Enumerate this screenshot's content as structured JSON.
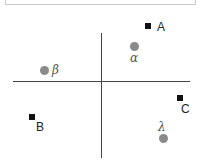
{
  "diagram": {
    "type": "quadrant-plot",
    "points": [
      {
        "id": "A",
        "shape": "square",
        "label": "A",
        "quadrant": "top-right"
      },
      {
        "id": "alpha",
        "shape": "circle",
        "label": "α",
        "quadrant": "top-right"
      },
      {
        "id": "beta",
        "shape": "circle",
        "label": "β",
        "quadrant": "top-left"
      },
      {
        "id": "B",
        "shape": "square",
        "label": "B",
        "quadrant": "bottom-left"
      },
      {
        "id": "C",
        "shape": "square",
        "label": "C",
        "quadrant": "bottom-right"
      },
      {
        "id": "lambda",
        "shape": "circle",
        "label": "λ",
        "quadrant": "bottom-right"
      }
    ],
    "colors": {
      "square": "#111111",
      "circle": "#8a8a8a",
      "axis": "#444444"
    }
  }
}
